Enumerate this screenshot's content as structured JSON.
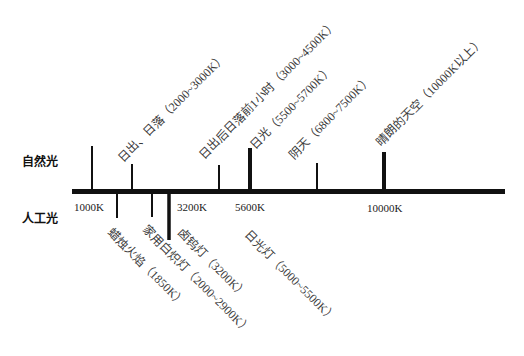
{
  "row_labels": {
    "natural": "自然光",
    "artificial": "人工光"
  },
  "axis": {
    "ticks": [
      {
        "label": "1000K"
      },
      {
        "label": "3200K"
      },
      {
        "label": "5600K"
      },
      {
        "label": "10000K"
      }
    ]
  },
  "natural_light": [
    {
      "label": "日出、日落（2000~3000K）"
    },
    {
      "label": "日出后日落前1小时（3000~4500K）"
    },
    {
      "label": "日光（5500~5700K）"
    },
    {
      "label": "阴天（6800~7500K）"
    },
    {
      "label": "晴朗的天空（10000K以上）"
    }
  ],
  "artificial_light": [
    {
      "label": "蜡烛火焰（1850K）"
    },
    {
      "label": "家用白炽灯（2000~2900K）"
    },
    {
      "label": "卤钨灯（3200K）"
    },
    {
      "label": "日光灯（5000~5500K）"
    }
  ],
  "colors": {
    "line": "#111111",
    "label_text": "#3a3a3a",
    "background": "#ffffff"
  }
}
